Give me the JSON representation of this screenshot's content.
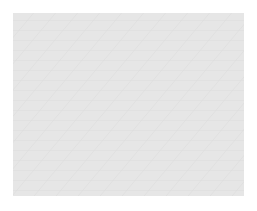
{
  "viewport": {
    "background": "#e6e6e6",
    "grid_color": "#d2d2d2",
    "frame": {
      "x": 13,
      "y": 13,
      "width": 231,
      "height": 183
    }
  },
  "cube": {
    "vertices": {
      "top_left": [
        67,
        50
      ],
      "top_back": [
        128,
        38
      ],
      "top_right": [
        211,
        45
      ],
      "top_front": [
        161,
        61
      ],
      "bottom_left": [
        71,
        153
      ],
      "bottom_front": [
        157,
        179
      ],
      "bottom_right": [
        206,
        142
      ]
    },
    "colors": {
      "front_face": "#a9a9a9",
      "right_face": "#4b4b4b",
      "top_face": "#7a7a7a",
      "edge": "#8c8c8c",
      "vertex": "#9a9a9a"
    }
  },
  "markers": [
    {
      "id": "top-edge-midpoint",
      "cx": 109,
      "cy": 55,
      "r": 12
    },
    {
      "id": "left-edge-midpoint",
      "cx": 68,
      "cy": 101,
      "r": 12
    },
    {
      "id": "right-edge-midpoint",
      "cx": 158,
      "cy": 122,
      "r": 12
    },
    {
      "id": "bottom-edge-midpoint",
      "cx": 111,
      "cy": 164,
      "r": 12
    }
  ],
  "marker_color": "#2a2a2a"
}
